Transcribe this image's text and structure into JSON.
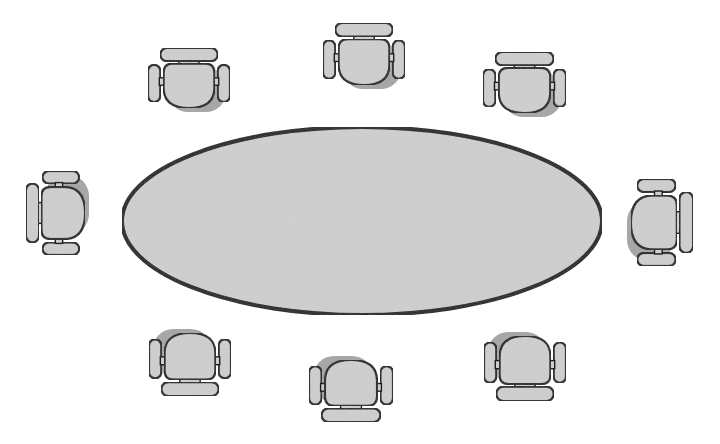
{
  "diagram": {
    "colors": {
      "background": "#ffffff",
      "fill": "#cfcfcf",
      "stroke": "#1e1e1e",
      "shadow": "#8a8a8a"
    },
    "table": {
      "shape": "ellipse",
      "cx": 362,
      "cy": 221,
      "rx": 240,
      "ry": 94
    },
    "chairs": [
      {
        "id": "top-left",
        "facing": "down",
        "x": 148,
        "y": 48,
        "w": 82,
        "h": 60
      },
      {
        "id": "top-center",
        "facing": "down",
        "x": 323,
        "y": 23,
        "w": 82,
        "h": 62
      },
      {
        "id": "top-right",
        "facing": "down",
        "x": 483,
        "y": 52,
        "w": 83,
        "h": 61
      },
      {
        "id": "left",
        "facing": "right",
        "x": 26,
        "y": 171,
        "w": 59,
        "h": 84
      },
      {
        "id": "right",
        "facing": "left",
        "x": 631,
        "y": 179,
        "w": 62,
        "h": 87
      },
      {
        "id": "bottom-left",
        "facing": "up",
        "x": 149,
        "y": 333,
        "w": 82,
        "h": 63
      },
      {
        "id": "bottom-center",
        "facing": "up",
        "x": 309,
        "y": 360,
        "w": 84,
        "h": 62
      },
      {
        "id": "bottom-right",
        "facing": "up",
        "x": 484,
        "y": 336,
        "w": 82,
        "h": 65
      }
    ],
    "chair_count": 8
  }
}
